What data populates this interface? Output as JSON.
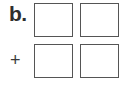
{
  "problem": {
    "label": "b.",
    "operator": "+",
    "rows": [
      {
        "boxes": [
          {
            "value": ""
          },
          {
            "value": ""
          }
        ]
      },
      {
        "boxes": [
          {
            "value": ""
          },
          {
            "value": ""
          }
        ]
      }
    ]
  },
  "colors": {
    "text": "#2e2e2e",
    "box_border": "#555555",
    "background": "#ffffff"
  }
}
